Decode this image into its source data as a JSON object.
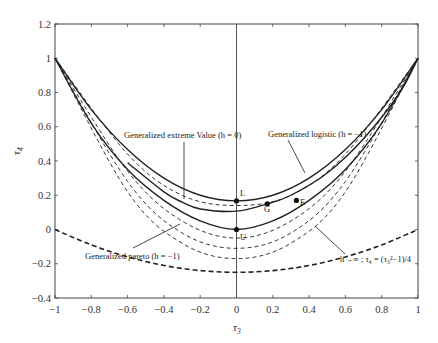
{
  "chart_data": {
    "type": "line",
    "title": "",
    "xlabel": "τ3",
    "ylabel": "τ4",
    "xlim": [
      -1,
      1
    ],
    "ylim": [
      -0.4,
      1.2
    ],
    "xticks": [
      "-1",
      "-0.8",
      "-0.6",
      "-0.4",
      "-0.2",
      "0",
      "0.2",
      "0.4",
      "0.6",
      "0.8",
      "1"
    ],
    "yticks": [
      "-0.4",
      "-0.2",
      "0",
      "0.2",
      "0.4",
      "0.6",
      "0.8",
      "1",
      "1.2"
    ],
    "grid": false,
    "legend": "none (inline annotations)",
    "series": [
      {
        "name": "Generalized logistic (h = -1)",
        "style": "solid",
        "x": [
          -1,
          -0.8,
          -0.6,
          -0.4,
          -0.2,
          0,
          0.2,
          0.4,
          0.6,
          0.8,
          1
        ],
        "y": [
          1,
          0.7,
          0.467,
          0.3,
          0.2,
          0.167,
          0.2,
          0.3,
          0.467,
          0.7,
          1
        ]
      },
      {
        "name": "Generalized extreme Value (h = 0)",
        "style": "solid",
        "x": [
          -0.6,
          -0.4,
          -0.3,
          -0.2,
          0,
          0.17,
          0.3,
          0.5,
          0.7,
          0.9,
          1
        ],
        "y": [
          0.39,
          0.22,
          0.16,
          0.12,
          0.107,
          0.15,
          0.2,
          0.33,
          0.53,
          0.8,
          1
        ]
      },
      {
        "name": "Generalized pareto (h = -1)",
        "style": "solid",
        "x": [
          -1,
          -0.8,
          -0.6,
          -0.4,
          -0.2,
          0,
          0.2,
          0.4,
          0.6,
          0.8,
          1
        ],
        "y": [
          1,
          0.62,
          0.35,
          0.17,
          0.05,
          0,
          0.05,
          0.17,
          0.35,
          0.62,
          1
        ]
      },
      {
        "name": "dashed bound 1",
        "style": "dashed",
        "x": [
          -1,
          -0.6,
          -0.3,
          0,
          0.3,
          0.6,
          1
        ],
        "y": [
          1,
          0.44,
          0.2,
          0.14,
          0.2,
          0.44,
          1
        ]
      },
      {
        "name": "dashed bound 2",
        "style": "dashed",
        "x": [
          -1,
          -0.6,
          -0.3,
          0,
          0.3,
          0.6,
          1
        ],
        "y": [
          1,
          0.34,
          0.05,
          -0.05,
          0.05,
          0.34,
          1
        ]
      },
      {
        "name": "dashed bound 3",
        "style": "dashed",
        "x": [
          -1,
          -0.6,
          -0.3,
          0,
          0.3,
          0.6,
          1
        ],
        "y": [
          1,
          0.28,
          -0.02,
          -0.11,
          -0.02,
          0.28,
          1
        ]
      },
      {
        "name": "dashed bound 4",
        "style": "dashed",
        "x": [
          -1,
          -0.6,
          -0.3,
          0,
          0.3,
          0.6,
          1
        ],
        "y": [
          1,
          0.22,
          -0.08,
          -0.17,
          -0.08,
          0.22,
          1
        ]
      },
      {
        "name": "h→∞ ; τ4 = (τ3²−1)/4",
        "style": "dashed-bold",
        "x": [
          -1,
          -0.8,
          -0.6,
          -0.4,
          -0.2,
          0,
          0.2,
          0.4,
          0.6,
          0.8,
          1
        ],
        "y": [
          0,
          -0.09,
          -0.16,
          -0.21,
          -0.24,
          -0.25,
          -0.24,
          -0.21,
          -0.16,
          -0.09,
          0
        ]
      }
    ],
    "points": [
      {
        "label": "L",
        "x": 0,
        "y": 0.167
      },
      {
        "label": "G",
        "x": 0.17,
        "y": 0.15
      },
      {
        "label": "E",
        "x": 0.33,
        "y": 0.17
      },
      {
        "label": "U",
        "x": 0,
        "y": 0.0
      }
    ],
    "annotations": [
      "Generalized extreme Value (h = 0)",
      "Generalized logistic (h = −1)",
      "Generalized pareto (h = −1)",
      "h→∞ ; τ4 = (τ3²−1)/4"
    ]
  },
  "labels": {
    "xlabel": "τ",
    "xlabel_sub": "3",
    "ylabel": "τ",
    "ylabel_sub": "4",
    "ann_gev": "Generalized extreme Value (h = 0)",
    "ann_glo": "Generalized logistic (h = −1)",
    "ann_gpa": "Generalized pareto (h = −1)",
    "ann_lim": "h→∞ ; τ₄ = (τ₃²−1)/4",
    "pt_L": "L",
    "pt_G": "G",
    "pt_E": "E",
    "pt_U": "U"
  }
}
